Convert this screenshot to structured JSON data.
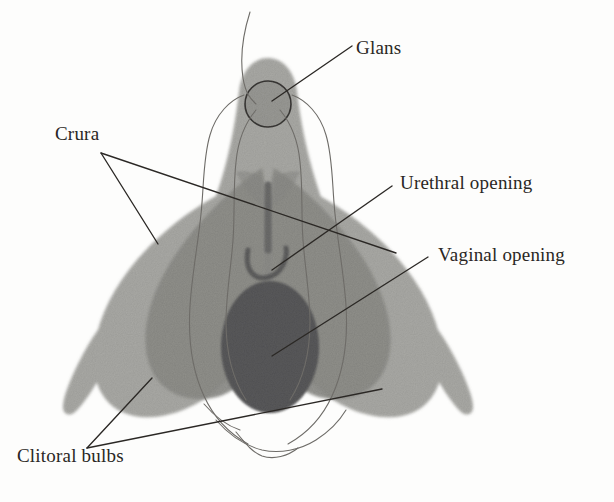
{
  "figure": {
    "kind": "anatomical-illustration",
    "background_color": "#fdfdfc",
    "ink_color": "#2a2724"
  },
  "palette": {
    "light_grey": "#a8a8a4",
    "mid_grey": "#8e8e8a",
    "dark_grey": "#59595a",
    "outline": "#3b3937",
    "contour": "#6e6c68"
  },
  "labels": [
    {
      "id": "glans",
      "text": "Glans"
    },
    {
      "id": "crura",
      "text": "Crura"
    },
    {
      "id": "urethral",
      "text": "Urethral opening"
    },
    {
      "id": "vaginal",
      "text": "Vaginal opening"
    },
    {
      "id": "bulbs",
      "text": "Clitoral bulbs"
    }
  ],
  "structures": [
    {
      "id": "glans-circle",
      "name": "Glans",
      "shade": "mid_grey"
    },
    {
      "id": "clitoral-body",
      "name": "Clitoral body",
      "shade": "light_grey"
    },
    {
      "id": "crus-left",
      "name": "Left crus",
      "shade": "light_grey"
    },
    {
      "id": "crus-right",
      "name": "Right crus",
      "shade": "light_grey"
    },
    {
      "id": "bulb-left",
      "name": "Left bulb",
      "shade": "mid_grey"
    },
    {
      "id": "bulb-right",
      "name": "Right bulb",
      "shade": "mid_grey"
    },
    {
      "id": "vaginal-oval",
      "name": "Vaginal opening",
      "shade": "dark_grey"
    },
    {
      "id": "urethra-tube",
      "name": "Urethra",
      "shade": "dark_grey"
    },
    {
      "id": "urethral-u",
      "name": "Urethral opening",
      "shade": "dark_grey"
    }
  ]
}
